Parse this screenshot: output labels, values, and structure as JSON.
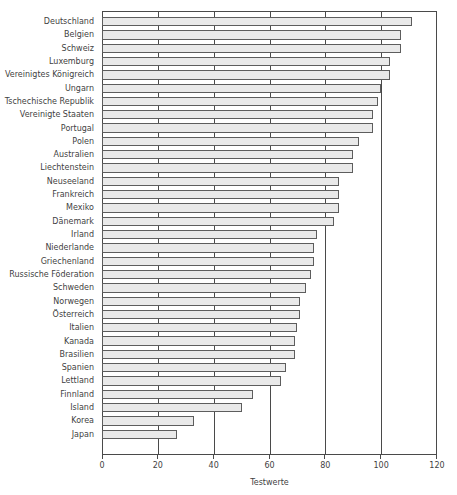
{
  "chart_data": {
    "type": "bar",
    "orientation": "horizontal",
    "title": "",
    "xlabel": "Testwerte",
    "ylabel": "",
    "xlim": [
      0,
      120
    ],
    "xticks": [
      0,
      20,
      40,
      60,
      80,
      100,
      120
    ],
    "grid": true,
    "grid_axis": "x",
    "legend": null,
    "bar_fill_color": "#e9e9e9",
    "bar_edge_color": "#5d5d5d",
    "axis_color": "#4a4a4a",
    "categories": [
      "Deutschland",
      "Belgien",
      "Schweiz",
      "Luxemburg",
      "Vereinigtes Königreich",
      "Ungarn",
      "Tschechische Republik",
      "Vereinigte Staaten",
      "Portugal",
      "Polen",
      "Australien",
      "Liechtenstein",
      "Neuseeland",
      "Frankreich",
      "Mexiko",
      "Dänemark",
      "Irland",
      "Niederlande",
      "Griechenland",
      "Russische Föderation",
      "Schweden",
      "Norwegen",
      "Österreich",
      "Italien",
      "Kanada",
      "Brasilien",
      "Spanien",
      "Lettland",
      "Finnland",
      "Island",
      "Korea",
      "Japan"
    ],
    "values": [
      111,
      107,
      107,
      103,
      103,
      100,
      99,
      97,
      97,
      92,
      90,
      90,
      85,
      85,
      85,
      83,
      77,
      76,
      76,
      75,
      73,
      71,
      71,
      70,
      69,
      69,
      66,
      64,
      54,
      50,
      33,
      27
    ]
  },
  "top_artifact": {
    "text": "·        ·     ·                    ·"
  }
}
